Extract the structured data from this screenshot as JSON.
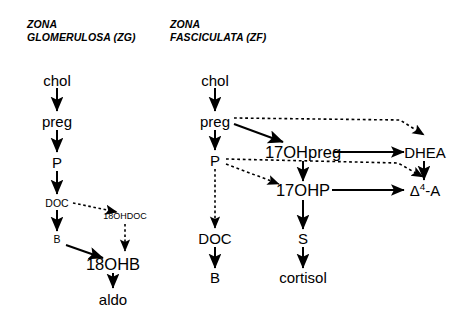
{
  "headings": {
    "left": "ZONA\nGLOMERULOSA (ZG)",
    "right": "ZONA\nFASCICULATA (ZF)"
  },
  "zona_glomerulosa": {
    "nodes": {
      "chol": "chol",
      "preg": "preg",
      "p": "P",
      "doc": "DOC",
      "b": "B",
      "ohdoc18": "18OHDOC",
      "ohb18": "18OHB",
      "aldo": "aldo"
    }
  },
  "zona_fasciculata": {
    "nodes": {
      "chol": "chol",
      "preg": "preg",
      "p": "P",
      "doc": "DOC",
      "b": "B",
      "ohpreg17": "17OHpreg",
      "ohp17": "17OHP",
      "s": "S",
      "cortisol": "cortisol",
      "dhea": "DHEA",
      "delta4a_symbol": "Δ",
      "delta4a_sup": "4",
      "delta4a_tail": "-A"
    }
  },
  "style": {
    "stroke": "#000000",
    "background": "#ffffff"
  }
}
